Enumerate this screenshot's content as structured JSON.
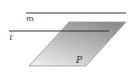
{
  "diagram": {
    "type": "geometry",
    "labels": {
      "line_m": "m",
      "line_l": "ℓ",
      "plane": "P"
    },
    "colors": {
      "line": "#333333",
      "plane_dark": "#8c8c8c",
      "plane_light": "#ececec",
      "plane_edge": "#9a9a9a"
    },
    "elements": [
      {
        "kind": "line",
        "name": "m",
        "from": [
          26,
          13
        ],
        "to": [
          126,
          13
        ]
      },
      {
        "kind": "line",
        "name": "ℓ",
        "from": [
          9,
          31
        ],
        "to": [
          109,
          31
        ]
      },
      {
        "kind": "plane",
        "name": "P",
        "corners": [
          [
            69,
            22
          ],
          [
            126,
            22
          ],
          [
            86,
            66
          ],
          [
            29,
            66
          ]
        ]
      }
    ]
  }
}
